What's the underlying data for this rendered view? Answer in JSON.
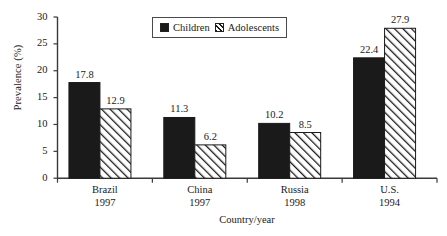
{
  "chart_data": {
    "type": "bar",
    "title": "",
    "xlabel": "Country/year",
    "ylabel": "Prevalence (%)",
    "ylim": [
      0,
      30
    ],
    "yticks": [
      0,
      5,
      10,
      15,
      20,
      25,
      30
    ],
    "ytick_labels": [
      "0",
      "5",
      "10",
      "15",
      "20",
      "25",
      "30"
    ],
    "grid": false,
    "legend_position": "top-center",
    "categories": [
      "Brazil",
      "China",
      "Russia",
      "U.S."
    ],
    "category_years": [
      "1997",
      "1997",
      "1998",
      "1994"
    ],
    "category_labels": [
      "Brazil\n1997",
      "China\n1997",
      "Russia\n1998",
      "U.S.\n1994"
    ],
    "series": [
      {
        "name": "Children",
        "fill": "solid-black",
        "color": "#1a1a1a",
        "values": [
          17.8,
          11.3,
          10.2,
          22.4
        ],
        "value_labels": [
          "17.8",
          "11.3",
          "10.2",
          "22.4"
        ]
      },
      {
        "name": "Adolescents",
        "fill": "diagonal-hatch",
        "color": "#ffffff",
        "values": [
          12.9,
          6.2,
          8.5,
          27.9
        ],
        "value_labels": [
          "12.9",
          "6.2",
          "8.5",
          "27.9"
        ]
      }
    ]
  },
  "legend": {
    "entries": [
      {
        "label": "Children",
        "swatch": "solid-square-icon"
      },
      {
        "label": "Adolescents",
        "swatch": "hatched-square-icon"
      }
    ]
  },
  "axes": {
    "y_title": "Prevalence (%)",
    "x_title": "Country/year"
  },
  "colors": {
    "series_children": "#1a1a1a",
    "series_adolescents": "#ffffff",
    "axis": "#3a3a3a",
    "text": "#1a1a1a",
    "background": "#ffffff"
  }
}
